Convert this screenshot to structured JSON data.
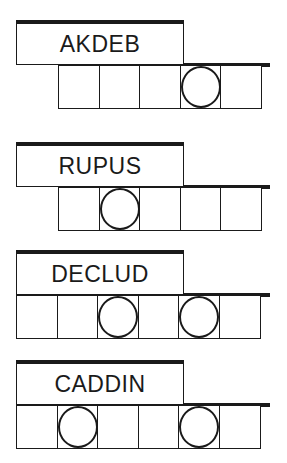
{
  "puzzles": [
    {
      "word": "AKDEB",
      "cells": 5,
      "circled": [
        3
      ]
    },
    {
      "word": "RUPUS",
      "cells": 5,
      "circled": [
        1
      ]
    },
    {
      "word": "DECLUD",
      "cells": 6,
      "circled": [
        2,
        4
      ]
    },
    {
      "word": "CADDIN",
      "cells": 6,
      "circled": [
        1,
        4
      ]
    }
  ]
}
